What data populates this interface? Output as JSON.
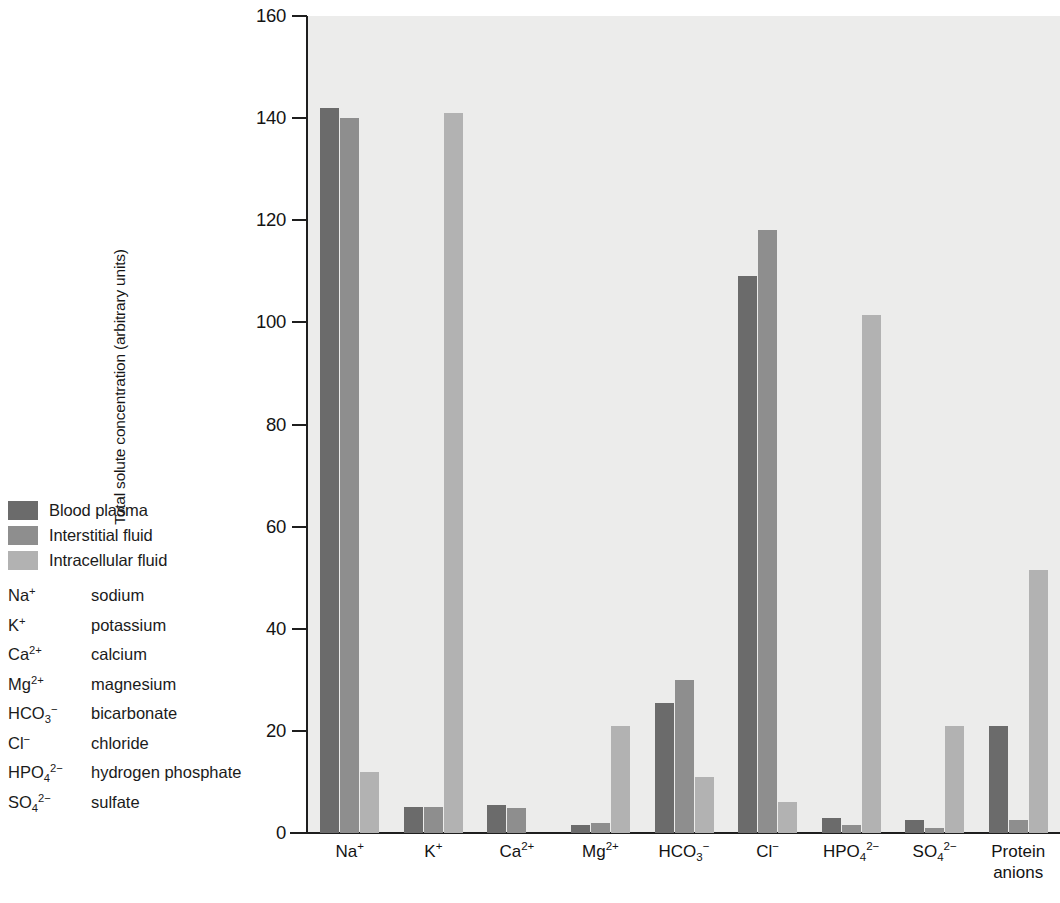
{
  "chart_data": {
    "type": "bar",
    "title": "",
    "xlabel": "",
    "ylabel": "Total solute concentration (arbitrary units)",
    "ylim": [
      0,
      160
    ],
    "yticks": [
      0,
      20,
      40,
      60,
      80,
      100,
      120,
      140,
      160
    ],
    "grid": false,
    "legend_position": "outside-left",
    "categories": [
      "Na⁺",
      "K⁺",
      "Ca²⁺",
      "Mg²⁺",
      "HCO₃⁻",
      "Cl⁻",
      "HPO₄²⁻",
      "SO₄²⁻",
      "Protein anions"
    ],
    "series": [
      {
        "name": "Blood plasma",
        "color": "#6b6b6b",
        "values": [
          142,
          5,
          5.5,
          1.5,
          25.5,
          109,
          3,
          2.5,
          21
        ]
      },
      {
        "name": "Interstitial fluid",
        "color": "#8e8e8e",
        "values": [
          140,
          5,
          4.8,
          2,
          30,
          118,
          1.5,
          1,
          2.5
        ]
      },
      {
        "name": "Intracellular fluid",
        "color": "#b2b2b2",
        "values": [
          12,
          141,
          0,
          21,
          11,
          6,
          101.5,
          21,
          51.5
        ]
      }
    ]
  },
  "legend": {
    "items": [
      {
        "label": "Blood plasma",
        "color": "#6b6b6b"
      },
      {
        "label": "Interstitial fluid",
        "color": "#8e8e8e"
      },
      {
        "label": "Intracellular fluid",
        "color": "#b2b2b2"
      }
    ]
  },
  "ion_key": {
    "rows": [
      {
        "formula_html": "Na<sup class=\"ch\">+</sup>",
        "name": "sodium"
      },
      {
        "formula_html": "K<sup class=\"ch\">+</sup>",
        "name": "potassium"
      },
      {
        "formula_html": "Ca<sup class=\"ch\">2+</sup>",
        "name": "calcium"
      },
      {
        "formula_html": "Mg<sup class=\"ch\">2+</sup>",
        "name": "magnesium"
      },
      {
        "formula_html": "HCO<sub class=\"ch\">3</sub><sup class=\"ch\">−</sup>",
        "name": "bicarbonate"
      },
      {
        "formula_html": "Cl<sup class=\"ch\">−</sup>",
        "name": "chloride"
      },
      {
        "formula_html": "HPO<sub class=\"ch\">4</sub><sup class=\"ch\">2−</sup>",
        "name": "hydrogen phosphate"
      },
      {
        "formula_html": "SO<sub class=\"ch\">4</sub><sup class=\"ch\">2−</sup>",
        "name": "sulfate"
      }
    ]
  },
  "xtick_html": [
    "Na<sup class=\"ch\">+</sup>",
    "K<sup class=\"ch\">+</sup>",
    "Ca<sup class=\"ch\">2+</sup>",
    "Mg<sup class=\"ch\">2+</sup>",
    "HCO<sub class=\"ch\">3</sub><sup class=\"ch\">−</sup>",
    "Cl<sup class=\"ch\">−</sup>",
    "HPO<sub class=\"ch\">4</sub><sup class=\"ch\">2−</sup>",
    "SO<sub class=\"ch\">4</sub><sup class=\"ch\">2−</sup>",
    "Protein<br>anions"
  ],
  "axes": {
    "plot_bg": "#ececeb",
    "axis_color": "#1e1e1e"
  }
}
